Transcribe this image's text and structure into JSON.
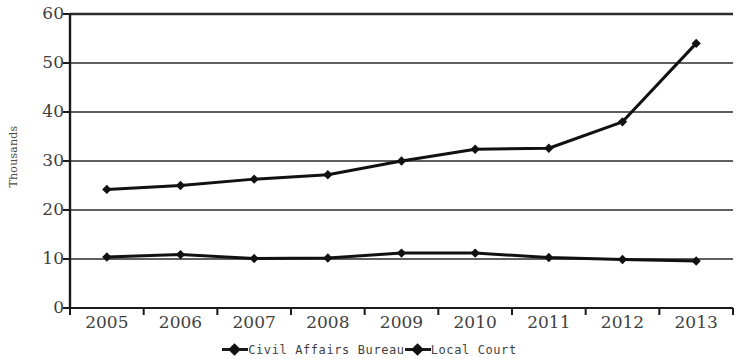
{
  "chart_data": {
    "type": "line",
    "title": "",
    "xlabel": "",
    "ylabel": "Thousands",
    "categories": [
      "2005",
      "2006",
      "2007",
      "2008",
      "2009",
      "2010",
      "2011",
      "2012",
      "2013"
    ],
    "series": [
      {
        "name": "Civil Affairs Bureau",
        "values": [
          24.2,
          25.0,
          26.3,
          27.2,
          30.0,
          32.4,
          32.6,
          38.0,
          54.0
        ],
        "marker": "diamond",
        "color": "#111111"
      },
      {
        "name": "Local Court",
        "values": [
          10.4,
          10.9,
          10.1,
          10.2,
          11.2,
          11.2,
          10.3,
          9.9,
          9.6
        ],
        "marker": "diamond",
        "color": "#111111"
      }
    ],
    "ylim": [
      0,
      60
    ],
    "y_ticks": [
      0,
      10,
      20,
      30,
      40,
      50,
      60
    ],
    "y_tick_labels": [
      "0",
      "10",
      "20",
      "30",
      "40",
      "50",
      "60"
    ],
    "grid": "horizontal",
    "legend_position": "bottom"
  },
  "legend": {
    "entries": [
      {
        "label": "Civil Affairs Bureau"
      },
      {
        "label": "Local Court"
      }
    ]
  },
  "axes": {
    "y_axis_title": "Thousands"
  },
  "colors": {
    "line": "#111111",
    "grid": "#2b2b2b",
    "axis": "#1a1a1a",
    "background": "#ffffff",
    "text": "#3f3f3f"
  }
}
